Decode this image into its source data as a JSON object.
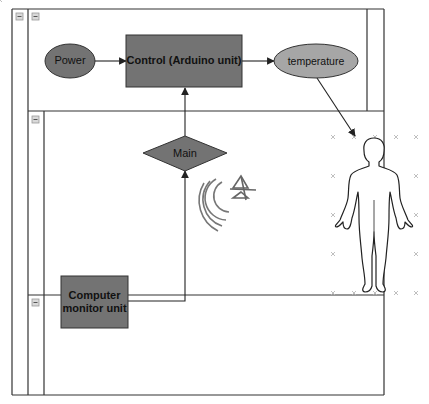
{
  "diagram": {
    "type": "swimlane-flowchart",
    "colors": {
      "lane_border": "#333333",
      "node_fill_dark": "#737373",
      "node_fill_light": "#a6a6a6",
      "node_stroke": "#333333",
      "edge": "#222222",
      "collapse_button_fill": "#d9d9d9",
      "grid_marker": "#b0b0b0"
    },
    "pool": {
      "name": "pool",
      "collapse_icon": "minus-icon"
    },
    "lanes": [
      {
        "id": "top-lane",
        "collapse_icon": "minus-icon"
      },
      {
        "id": "middle-lane",
        "collapse_icon": "minus-icon"
      },
      {
        "id": "bottom-lane",
        "collapse_icon": "minus-icon"
      }
    ],
    "nodes": {
      "power": {
        "label": "Power",
        "shape": "ellipse"
      },
      "control": {
        "label": "Control (Arduino unit)",
        "shape": "rectangle"
      },
      "temperature": {
        "label": "temperature",
        "shape": "ellipse"
      },
      "main": {
        "label": "Main",
        "shape": "diamond"
      },
      "computer": {
        "label_line1": "Computer",
        "label_line2": "monitor unit",
        "shape": "rectangle"
      },
      "wireless": {
        "icon": "wireless-signal-icon"
      },
      "human": {
        "icon": "human-body-icon"
      }
    },
    "edges": [
      {
        "from": "power",
        "to": "control"
      },
      {
        "from": "control",
        "to": "temperature"
      },
      {
        "from": "temperature",
        "to": "human"
      },
      {
        "from": "main",
        "to": "control"
      },
      {
        "from": "computer",
        "to": "main"
      }
    ]
  }
}
